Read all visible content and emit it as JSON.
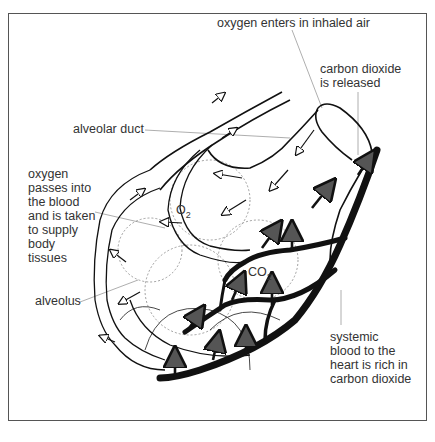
{
  "diagram": {
    "labels": {
      "oxygen_enters": "oxygen enters in inhaled air",
      "co2_released": "carbon dioxide\nis released",
      "alveolar_duct": "alveolar duct",
      "oxygen_passes": "oxygen\npasses into\nthe blood\nand is taken\nto supply\nbody\ntissues",
      "alveolus": "alveolus",
      "systemic_blood": "systemic\nblood to the\nheart is rich in\ncarbon dioxide"
    },
    "chem": {
      "o2_base": "O",
      "o2_sub": "2",
      "co2_base": "CO",
      "co2_sub": "2"
    },
    "colors": {
      "frame": "#555555",
      "ink": "#111111",
      "text": "#333333",
      "leader": "#999999",
      "background": "#ffffff"
    }
  }
}
